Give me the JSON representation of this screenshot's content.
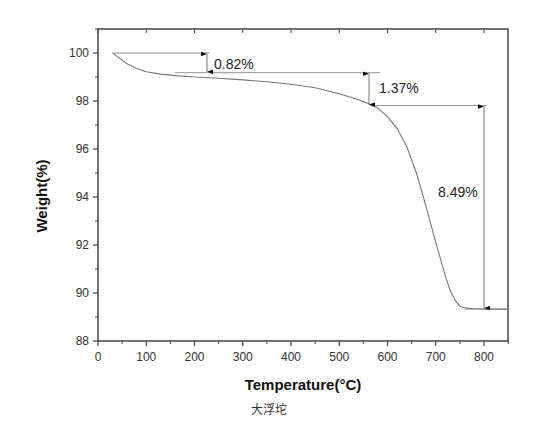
{
  "chart_data": {
    "type": "line",
    "title": "",
    "xlabel": "Temperature(°C)",
    "ylabel": "Weight(%)",
    "xlim": [
      0,
      850
    ],
    "ylim": [
      88,
      101
    ],
    "x_ticks": [
      0,
      100,
      200,
      300,
      400,
      500,
      600,
      700,
      800
    ],
    "y_ticks": [
      88,
      90,
      92,
      94,
      96,
      98,
      100
    ],
    "grid": false,
    "legend": null,
    "series": [
      {
        "name": "TGA",
        "x": [
          30,
          40,
          60,
          80,
          100,
          130,
          160,
          200,
          250,
          300,
          350,
          400,
          450,
          500,
          540,
          560,
          580,
          600,
          620,
          640,
          660,
          680,
          700,
          710,
          720,
          730,
          740,
          750,
          760,
          780,
          800,
          850
        ],
        "y": [
          100.0,
          99.85,
          99.55,
          99.35,
          99.22,
          99.12,
          99.06,
          99.0,
          98.95,
          98.88,
          98.8,
          98.7,
          98.55,
          98.3,
          98.05,
          97.9,
          97.7,
          97.35,
          96.85,
          96.1,
          95.0,
          93.6,
          92.1,
          91.4,
          90.7,
          90.1,
          89.7,
          89.45,
          89.38,
          89.34,
          89.33,
          89.33
        ]
      }
    ],
    "annotations": [
      {
        "label": "0.82%",
        "from_y": 100.0,
        "to_y": 99.18,
        "x": 225
      },
      {
        "label": "1.37%",
        "from_y": 99.18,
        "to_y": 97.81,
        "x": 560
      },
      {
        "label": "8.49%",
        "from_y": 97.81,
        "to_y": 89.33,
        "x": 800
      }
    ]
  },
  "labels": {
    "xlabel": "Temperature(°C)",
    "ylabel": "Weight(%)",
    "annot1": "0.82%",
    "annot2": "1.37%",
    "annot3": "8.49%",
    "caption": "大浮坨"
  }
}
